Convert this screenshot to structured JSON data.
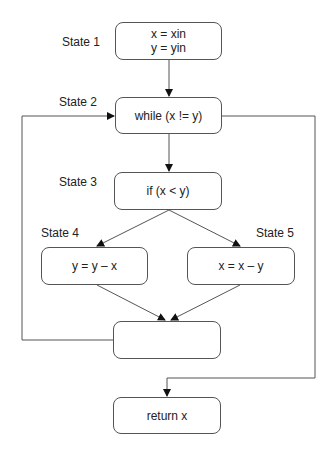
{
  "diagram": {
    "type": "flowchart",
    "nodes": [
      {
        "id": "n1",
        "state": "State 1",
        "lines": [
          "x = xin",
          "y = yin"
        ]
      },
      {
        "id": "n2",
        "state": "State 2",
        "lines": [
          "while (x != y)"
        ]
      },
      {
        "id": "n3",
        "state": "State 3",
        "lines": [
          "if (x < y)"
        ]
      },
      {
        "id": "n4",
        "state": "State 4",
        "lines": [
          "y = y – x"
        ]
      },
      {
        "id": "n5",
        "state": "State 5",
        "lines": [
          "x = x – y"
        ]
      },
      {
        "id": "n6",
        "state": "",
        "lines": []
      },
      {
        "id": "n7",
        "state": "",
        "lines": [
          "return x"
        ]
      }
    ],
    "edges": [
      {
        "from": "n1",
        "to": "n2"
      },
      {
        "from": "n2",
        "to": "n3"
      },
      {
        "from": "n3",
        "to": "n4"
      },
      {
        "from": "n3",
        "to": "n5"
      },
      {
        "from": "n4",
        "to": "n6"
      },
      {
        "from": "n5",
        "to": "n6"
      },
      {
        "from": "n6",
        "to": "n2"
      },
      {
        "from": "n2",
        "to": "n7"
      }
    ]
  }
}
